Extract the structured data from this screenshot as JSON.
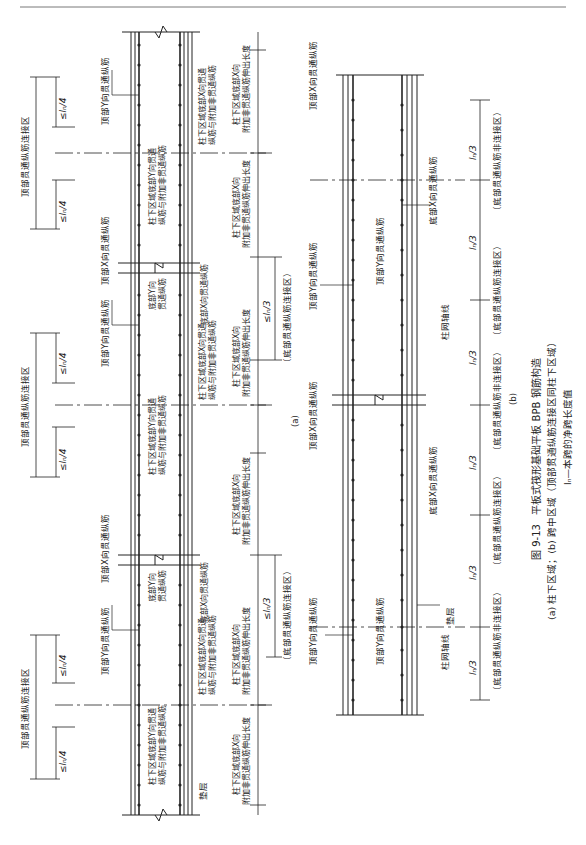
{
  "figure": {
    "number": "图 9-13",
    "title": "平板式筏形基础平板 BPB 钢筋构造",
    "subcaption": "(a) 柱下区域；(b) 跨中区域（顶部贯通纵筋连接区同柱下区域）",
    "note": "lₙ—本跨的净跨长度值",
    "panel_a_label": "(a)",
    "panel_b_label": "(b)"
  },
  "panel_a": {
    "labels": {
      "top_y_rebar": "顶部Y向贯通纵筋",
      "top_x_rebar": "顶部X向贯通纵筋",
      "bottom_y_rebar_line1": "底部Y向",
      "bottom_y_rebar_line2": "贯通纵筋",
      "bottom_x_rebar": "底部X向贯通纵筋",
      "col_bottom_y_line1": "柱下区域底部Y向贯通",
      "col_bottom_y_line2": "纵筋与附加非贯通纵筋",
      "col_bottom_x_line1": "柱下区域底部X向贯通",
      "col_bottom_x_line2": "纵筋与附加非贯通纵筋",
      "extension_line1": "柱下区域底部X向",
      "extension_line2": "附加非贯通纵筋伸出长度",
      "top_splice_zone": "顶部贯通纵筋连接区",
      "bottom_splice_zone": "（底部贯通纵筋连接区）",
      "cushion": "垫层",
      "dim_quarter": "≤lₙ/4",
      "dim_third": "≤lₙ/3"
    }
  },
  "panel_b": {
    "labels": {
      "top_x_rebar": "顶部X向贯通纵筋",
      "top_y_rebar": "顶部Y向贯通纵筋",
      "bottom_x_rebar": "底部X向贯通纵筋",
      "column_axis": "柱网轴线",
      "cushion": "垫层",
      "non_splice_zone": "（底部贯通纵筋非连接区）",
      "splice_zone": "（底部贯通纵筋连接区）",
      "dim_third": "lₙ/3"
    }
  }
}
